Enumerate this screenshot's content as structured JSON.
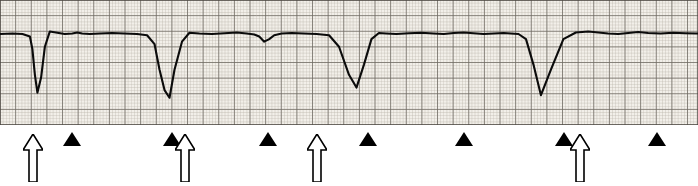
{
  "figure": {
    "caption": "",
    "strip_background": "#f2efe9",
    "grid_minor_color": "#b9b3a8",
    "grid_major_color": "#6e6a62",
    "trace_color": "#0b0b0b",
    "marker_color": "#000000",
    "marker_open_fill": "#ffffff"
  },
  "chart_data": {
    "type": "line",
    "title": "",
    "subtitle": "",
    "xlabel": "",
    "ylabel": "",
    "grid": true,
    "legend_position": "none",
    "axis": {
      "x_units": "seconds (25 mm/s, 1 large box = 0.20 s)",
      "y_units": "millivolts (10 mm/mV, 1 large box = 0.5 mV)",
      "xlim": [
        0,
        5.6
      ],
      "ylim": [
        -2.6,
        0.6
      ],
      "grid_minor_mm": 1,
      "grid_major_mm": 5
    },
    "series": [
      {
        "name": "lead-II rhythm strip",
        "baseline_mv": 0.0,
        "x": [
          0.0,
          0.1,
          0.18,
          0.24,
          0.26,
          0.28,
          0.3,
          0.33,
          0.36,
          0.4,
          0.46,
          0.52,
          0.58,
          0.62,
          0.66,
          0.72,
          0.8,
          0.9,
          1.0,
          1.1,
          1.18,
          1.24,
          1.28,
          1.32,
          1.36,
          1.4,
          1.46,
          1.52,
          1.6,
          1.7,
          1.8,
          1.9,
          1.98,
          2.04,
          2.08,
          2.12,
          2.16,
          2.2,
          2.26,
          2.34,
          2.44,
          2.54,
          2.64,
          2.72,
          2.8,
          2.86,
          2.92,
          2.98,
          3.04,
          3.1,
          3.18,
          3.28,
          3.38,
          3.48,
          3.56,
          3.64,
          3.72,
          3.8,
          3.88,
          3.96,
          4.04,
          4.1,
          4.16,
          4.22,
          4.28,
          4.34,
          4.42,
          4.52,
          4.62,
          4.72,
          4.8,
          4.88,
          4.96,
          5.04,
          5.12,
          5.2,
          5.3,
          5.4,
          5.5,
          5.6
        ],
        "y": [
          0.0,
          0.02,
          0.0,
          -0.1,
          -0.6,
          -1.6,
          -2.3,
          -1.7,
          -0.5,
          0.1,
          0.05,
          0.0,
          0.02,
          0.06,
          0.02,
          0.0,
          0.02,
          0.04,
          0.02,
          0.0,
          -0.05,
          -0.4,
          -1.4,
          -2.2,
          -2.5,
          -1.4,
          -0.3,
          0.05,
          0.02,
          0.0,
          0.03,
          0.06,
          0.02,
          -0.02,
          -0.1,
          -0.3,
          -0.2,
          -0.05,
          0.02,
          0.04,
          0.02,
          0.0,
          -0.05,
          -0.5,
          -1.6,
          -2.1,
          -1.2,
          -0.2,
          0.04,
          0.02,
          0.0,
          0.03,
          0.05,
          0.02,
          0.0,
          0.04,
          0.06,
          0.03,
          0.0,
          0.02,
          0.04,
          0.02,
          0.0,
          -0.2,
          -1.2,
          -2.4,
          -1.4,
          -0.2,
          0.06,
          0.1,
          0.06,
          0.02,
          0.0,
          0.04,
          0.08,
          0.04,
          0.02,
          0.05,
          0.03,
          0.02
        ]
      }
    ],
    "annotations": [
      {
        "type": "open-arrow",
        "label": "open-arrow-1",
        "x_px": 33,
        "x_s": 0.26,
        "meaning": "deep negative QRS complex"
      },
      {
        "type": "solid-arrow",
        "label": "solid-arrow-1",
        "x_px": 72,
        "x_s": 0.58,
        "meaning": "P wave"
      },
      {
        "type": "solid-arrow",
        "label": "solid-arrow-2",
        "x_px": 172,
        "x_s": 1.38,
        "meaning": "P wave"
      },
      {
        "type": "open-arrow",
        "label": "open-arrow-2",
        "x_px": 185,
        "x_s": 1.48,
        "meaning": "deep negative QRS complex"
      },
      {
        "type": "solid-arrow",
        "label": "solid-arrow-3",
        "x_px": 268,
        "x_s": 2.14,
        "meaning": "P wave"
      },
      {
        "type": "open-arrow",
        "label": "open-arrow-3",
        "x_px": 317,
        "x_s": 2.54,
        "meaning": "deep negative QRS complex"
      },
      {
        "type": "solid-arrow",
        "label": "solid-arrow-4",
        "x_px": 368,
        "x_s": 2.94,
        "meaning": "P wave"
      },
      {
        "type": "solid-arrow",
        "label": "solid-arrow-5",
        "x_px": 464,
        "x_s": 3.71,
        "meaning": "P wave"
      },
      {
        "type": "solid-arrow",
        "label": "solid-arrow-6",
        "x_px": 564,
        "x_s": 4.51,
        "meaning": "P wave"
      },
      {
        "type": "open-arrow",
        "label": "open-arrow-4",
        "x_px": 580,
        "x_s": 4.64,
        "meaning": "deep negative QRS complex"
      },
      {
        "type": "solid-arrow",
        "label": "solid-arrow-7",
        "x_px": 657,
        "x_s": 5.26,
        "meaning": "P wave"
      }
    ]
  }
}
